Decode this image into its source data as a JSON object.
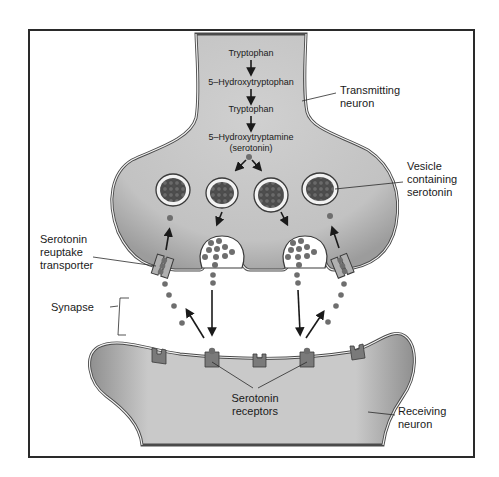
{
  "pathway": {
    "steps": [
      "Tryptophan",
      "5–Hydroxytryptophan",
      "Tryptophan",
      "5–Hydroxytryptamine",
      "(serotonin)"
    ]
  },
  "labels": {
    "transmitting_neuron": [
      "Transmitting",
      "neuron"
    ],
    "vesicle": [
      "Vesicle",
      "containing",
      "serotonin"
    ],
    "reuptake_transporter": [
      "Serotonin",
      "reuptake",
      "transporter"
    ],
    "synapse": "Synapse",
    "receptors": [
      "Serotonin",
      "receptors"
    ],
    "receiving_neuron": [
      "Receiving",
      "neuron"
    ]
  },
  "colors": {
    "neuron_fill": "#c4c4c4",
    "neuron_shade": "#9a9a9a",
    "membrane": "#4a4a4a",
    "vesicle_core": "#5a5a5a",
    "dot": "#6e6e6e",
    "transporter": "#b0b0b0",
    "receptor": "#7a7a7a",
    "frame": "#2a2a2a"
  }
}
